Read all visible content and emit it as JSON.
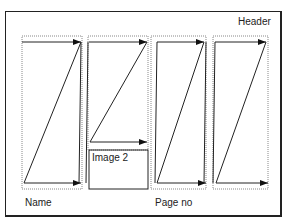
{
  "diagram": {
    "header_label": "Header",
    "name_label": "Name",
    "page_no_label": "Page no",
    "image_label": "Image 2",
    "colors": {
      "line": "#222222",
      "dotted": "#888888",
      "background": "#ffffff"
    },
    "columns": [
      {
        "id": "column-1",
        "x1": 22,
        "x2": 82
      },
      {
        "id": "column-2",
        "x1": 88,
        "x2": 148
      },
      {
        "id": "column-3",
        "x1": 151,
        "x2": 206
      },
      {
        "id": "column-4",
        "x1": 213,
        "x2": 268
      }
    ],
    "flow_icon": "z-shaped-reading-flow-arrows"
  }
}
